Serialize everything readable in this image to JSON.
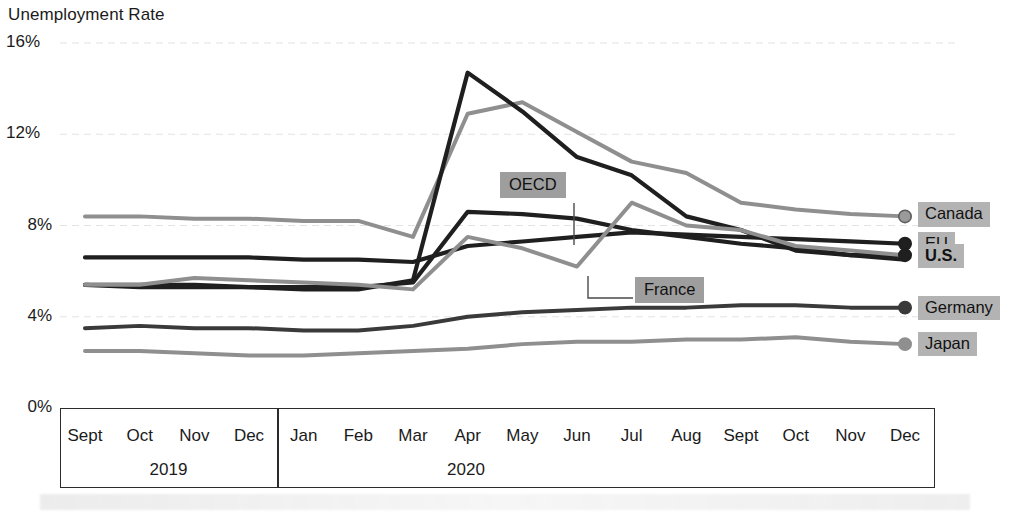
{
  "chart_data": {
    "type": "line",
    "title": "Unemployment Rate",
    "xlabel": "",
    "ylabel": "Unemployment Rate",
    "ylim": [
      0,
      16
    ],
    "yticks": [
      "0%",
      "4%",
      "8%",
      "12%",
      "16%"
    ],
    "ytick_values": [
      0,
      4,
      8,
      12,
      16
    ],
    "grid": true,
    "legend_position": "right-endpoint-labels",
    "categories": [
      "Sept",
      "Oct",
      "Nov",
      "Dec",
      "Jan",
      "Feb",
      "Mar",
      "Apr",
      "May",
      "Jun",
      "Jul",
      "Aug",
      "Sept",
      "Oct",
      "Nov",
      "Dec"
    ],
    "period_groups": [
      {
        "label": "2019",
        "months": [
          "Sept",
          "Oct",
          "Nov",
          "Dec"
        ]
      },
      {
        "label": "2020",
        "months": [
          "Jan",
          "Feb",
          "Mar",
          "Apr",
          "May",
          "Jun",
          "Jul",
          "Aug",
          "Sept",
          "Oct",
          "Nov",
          "Dec"
        ]
      }
    ],
    "series": [
      {
        "name": "Canada",
        "color": "#8f8f8f",
        "label_bold": false,
        "values": [
          8.4,
          8.4,
          8.3,
          8.3,
          8.2,
          8.2,
          7.5,
          12.9,
          13.4,
          12.1,
          10.8,
          10.3,
          9.0,
          8.7,
          8.5,
          8.4
        ]
      },
      {
        "name": "EU",
        "color": "#1f1f1f",
        "label_bold": false,
        "values": [
          6.6,
          6.6,
          6.6,
          6.6,
          6.5,
          6.5,
          6.4,
          7.1,
          7.3,
          7.5,
          7.7,
          7.6,
          7.5,
          7.4,
          7.3,
          7.2
        ]
      },
      {
        "name": "U.S.",
        "color": "#1f1f1f",
        "label_bold": true,
        "values": [
          5.4,
          5.3,
          5.3,
          5.3,
          5.2,
          5.2,
          5.6,
          14.7,
          13.0,
          11.0,
          10.2,
          8.4,
          7.8,
          6.9,
          6.7,
          6.7
        ]
      },
      {
        "name": "OECD",
        "color": "#1f1f1f",
        "label_bold": false,
        "values": [
          5.4,
          5.4,
          5.4,
          5.3,
          5.3,
          5.3,
          5.5,
          8.6,
          8.5,
          8.3,
          7.8,
          7.5,
          7.2,
          7.0,
          6.7,
          6.5
        ]
      },
      {
        "name": "France",
        "color": "#8f8f8f",
        "label_bold": false,
        "values": [
          5.4,
          5.4,
          5.7,
          5.6,
          5.5,
          5.4,
          5.2,
          7.5,
          7.0,
          6.2,
          9.0,
          8.0,
          7.8,
          7.1,
          6.9,
          6.7
        ]
      },
      {
        "name": "Germany",
        "color": "#3a3a3a",
        "label_bold": false,
        "values": [
          3.5,
          3.6,
          3.5,
          3.5,
          3.4,
          3.4,
          3.6,
          4.0,
          4.2,
          4.3,
          4.4,
          4.4,
          4.5,
          4.5,
          4.4,
          4.4
        ]
      },
      {
        "name": "Japan",
        "color": "#8f8f8f",
        "label_bold": false,
        "values": [
          2.5,
          2.5,
          2.4,
          2.3,
          2.3,
          2.4,
          2.5,
          2.6,
          2.8,
          2.9,
          2.9,
          3.0,
          3.0,
          3.1,
          2.9,
          2.8
        ]
      }
    ],
    "endpoint_labels": [
      {
        "name": "Canada",
        "bold": false
      },
      {
        "name": "EU",
        "bold": false
      },
      {
        "name": "U.S.",
        "bold": true
      },
      {
        "name": "Germany",
        "bold": false
      },
      {
        "name": "Japan",
        "bold": false
      }
    ],
    "annotations": [
      {
        "text": "OECD",
        "kind": "callout"
      },
      {
        "text": "France",
        "kind": "callout"
      }
    ],
    "colors": {
      "dark_line": "#1f1f1f",
      "mid_line": "#3a3a3a",
      "gray_line": "#8f8f8f",
      "label_bg": "#b3b3b3",
      "callout_bg": "#9e9e9e",
      "axis": "#2b2b2b",
      "grid": "#e3e3e3",
      "text": "#1b1b1b",
      "background": "#ffffff"
    }
  }
}
